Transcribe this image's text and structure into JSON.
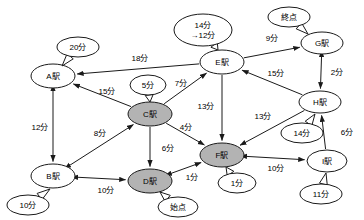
{
  "diagram": {
    "unit_suffix": "分",
    "colors": {
      "stroke": "#1a1a1a",
      "node_fill_default": "#ffffff",
      "node_fill_visited": "#b3b3b3",
      "background": "#ffffff"
    },
    "nodes": [
      {
        "id": "A",
        "label": "A駅",
        "x": 53,
        "y": 76,
        "rx": 22,
        "ry": 12,
        "state": "open"
      },
      {
        "id": "B",
        "label": "B駅",
        "x": 53,
        "y": 176,
        "rx": 22,
        "ry": 12,
        "state": "open"
      },
      {
        "id": "C",
        "label": "C駅",
        "x": 150,
        "y": 114,
        "rx": 22,
        "ry": 12,
        "state": "visited"
      },
      {
        "id": "D",
        "label": "D駅",
        "x": 150,
        "y": 181,
        "rx": 22,
        "ry": 12,
        "state": "visited"
      },
      {
        "id": "E",
        "label": "E駅",
        "x": 222,
        "y": 62,
        "rx": 22,
        "ry": 12,
        "state": "open"
      },
      {
        "id": "F",
        "label": "F駅",
        "x": 222,
        "y": 155,
        "rx": 22,
        "ry": 12,
        "state": "visited"
      },
      {
        "id": "G",
        "label": "G駅",
        "x": 322,
        "y": 43,
        "rx": 21,
        "ry": 11,
        "state": "open"
      },
      {
        "id": "H",
        "label": "H駅",
        "x": 320,
        "y": 102,
        "rx": 21,
        "ry": 11,
        "state": "open"
      },
      {
        "id": "I",
        "label": "I駅",
        "x": 327,
        "y": 161,
        "rx": 20,
        "ry": 11,
        "state": "open"
      }
    ],
    "node_callouts": [
      {
        "id": "callout-A",
        "node": "A",
        "lines": [
          "20分"
        ],
        "x": 78,
        "y": 47,
        "rx": 21,
        "ry": 10,
        "tail_to_x": 62,
        "tail_to_y": 66
      },
      {
        "id": "callout-B",
        "node": "B",
        "lines": [
          "10分"
        ],
        "x": 28,
        "y": 205,
        "rx": 21,
        "ry": 10,
        "tail_to_x": 50,
        "tail_to_y": 189
      },
      {
        "id": "callout-C",
        "node": "C",
        "lines": [
          "5分"
        ],
        "x": 148,
        "y": 85,
        "rx": 18,
        "ry": 10,
        "tail_to_x": 150,
        "tail_to_y": 102
      },
      {
        "id": "callout-D",
        "node": "D",
        "lines": [
          "始点"
        ],
        "x": 178,
        "y": 207,
        "rx": 20,
        "ry": 10,
        "tail_to_x": 160,
        "tail_to_y": 192
      },
      {
        "id": "callout-E",
        "node": "E",
        "lines": [
          "14分",
          "→12分"
        ],
        "x": 203,
        "y": 30,
        "rx": 29,
        "ry": 16,
        "tail_to_x": 218,
        "tail_to_y": 50
      },
      {
        "id": "callout-F",
        "node": "F",
        "lines": [
          "1分"
        ],
        "x": 237,
        "y": 183,
        "rx": 19,
        "ry": 10,
        "tail_to_x": 226,
        "tail_to_y": 167
      },
      {
        "id": "callout-G",
        "node": "G",
        "lines": [
          "終点"
        ],
        "x": 289,
        "y": 17,
        "rx": 21,
        "ry": 10,
        "tail_to_x": 308,
        "tail_to_y": 34
      },
      {
        "id": "callout-H",
        "node": "H",
        "lines": [
          "14分"
        ],
        "x": 302,
        "y": 133,
        "rx": 21,
        "ry": 10,
        "tail_to_x": 315,
        "tail_to_y": 114
      },
      {
        "id": "callout-I",
        "node": "I",
        "lines": [
          "11分"
        ],
        "x": 321,
        "y": 194,
        "rx": 21,
        "ry": 10,
        "tail_to_x": 326,
        "tail_to_y": 173
      }
    ],
    "edges": [
      {
        "id": "edge-E-A",
        "from": "E",
        "to": "A",
        "weight": "18分",
        "direction": "forward",
        "label_x": 140,
        "label_y": 58
      },
      {
        "id": "edge-C-A",
        "from": "C",
        "to": "A",
        "weight": "15分",
        "direction": "forward",
        "label_x": 107,
        "label_y": 91
      },
      {
        "id": "edge-C-E",
        "from": "C",
        "to": "E",
        "weight": "7分",
        "direction": "forward",
        "label_x": 181,
        "label_y": 83
      },
      {
        "id": "edge-A-B",
        "from": "A",
        "to": "B",
        "weight": "12分",
        "direction": "both",
        "label_x": 40,
        "label_y": 127
      },
      {
        "id": "edge-B-C",
        "from": "B",
        "to": "C",
        "weight": "8分",
        "direction": "both",
        "label_x": 100,
        "label_y": 133
      },
      {
        "id": "edge-C-D",
        "from": "C",
        "to": "D",
        "weight": "6分",
        "direction": "forward",
        "label_x": 168,
        "label_y": 148
      },
      {
        "id": "edge-B-D",
        "from": "B",
        "to": "D",
        "weight": "10分",
        "direction": "both",
        "label_x": 106,
        "label_y": 190
      },
      {
        "id": "edge-C-F",
        "from": "C",
        "to": "F",
        "weight": "4分",
        "direction": "forward",
        "label_x": 186,
        "label_y": 127
      },
      {
        "id": "edge-E-F",
        "from": "E",
        "to": "F",
        "weight": "13分",
        "direction": "forward",
        "label_x": 206,
        "label_y": 106
      },
      {
        "id": "edge-H-F",
        "from": "H",
        "to": "F",
        "weight": "13分",
        "direction": "forward",
        "label_x": 263,
        "label_y": 116
      },
      {
        "id": "edge-D-F",
        "from": "D",
        "to": "F",
        "weight": "1分",
        "direction": "both",
        "label_x": 192,
        "label_y": 177
      },
      {
        "id": "edge-E-G",
        "from": "E",
        "to": "G",
        "weight": "9分",
        "direction": "forward",
        "label_x": 272,
        "label_y": 38
      },
      {
        "id": "edge-H-E",
        "from": "H",
        "to": "E",
        "weight": "15分",
        "direction": "forward",
        "label_x": 276,
        "label_y": 73
      },
      {
        "id": "edge-G-H",
        "from": "G",
        "to": "H",
        "weight": "2分",
        "direction": "both",
        "label_x": 337,
        "label_y": 72
      },
      {
        "id": "edge-I-H",
        "from": "I",
        "to": "H",
        "weight": "6分",
        "direction": "forward",
        "label_x": 347,
        "label_y": 132
      },
      {
        "id": "edge-F-I",
        "from": "F",
        "to": "I",
        "weight": "10分",
        "direction": "both",
        "label_x": 276,
        "label_y": 168
      }
    ]
  }
}
